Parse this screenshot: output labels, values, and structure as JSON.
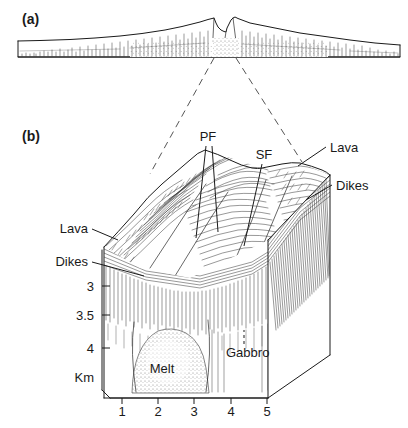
{
  "figure": {
    "panels": [
      {
        "id": "a",
        "label": "(a)",
        "caption_text": "(a)",
        "description": "Vertically exaggerated cross-section profile of a mid-ocean ridge with central axial valley"
      },
      {
        "id": "b",
        "label": "(b)",
        "caption_text": "(b)",
        "description": "Three-dimensional block diagram of the axial valley showing crustal structure"
      }
    ]
  },
  "panel_a": {
    "label": "(a)"
  },
  "panel_b": {
    "label": "(b)",
    "annotations": [
      {
        "key": "pf",
        "text": "PF",
        "x": 208,
        "y": 140
      },
      {
        "key": "sf",
        "text": "SF",
        "x": 262,
        "y": 158
      },
      {
        "key": "lava_right",
        "text": "Lava",
        "x": 330,
        "y": 150
      },
      {
        "key": "dikes_right",
        "text": "Dikes",
        "x": 336,
        "y": 188
      },
      {
        "key": "lava_left",
        "text": "Lava",
        "x": 66,
        "y": 232
      },
      {
        "key": "dikes_left",
        "text": "Dikes",
        "x": 58,
        "y": 265
      },
      {
        "key": "gabbro",
        "text": "Gabbro",
        "x": 226,
        "y": 355
      },
      {
        "key": "melt",
        "text": "Melt",
        "x": 162,
        "y": 371
      }
    ],
    "vertical_axis": {
      "unit_label": "Km",
      "ticks": [
        {
          "value": "3",
          "y": 286
        },
        {
          "value": "3.5",
          "y": 315
        },
        {
          "value": "4",
          "y": 348
        }
      ]
    },
    "horizontal_axis": {
      "ticks": [
        {
          "value": "1",
          "x": 122
        },
        {
          "value": "2",
          "x": 158
        },
        {
          "value": "3",
          "x": 194
        },
        {
          "value": "4",
          "x": 231
        },
        {
          "value": "5",
          "x": 267
        }
      ]
    }
  },
  "colors": {
    "ink": "#1a1a1a",
    "hatch": "#333333",
    "connector": "#555555",
    "background": "#ffffff",
    "stipple": "#666666"
  }
}
